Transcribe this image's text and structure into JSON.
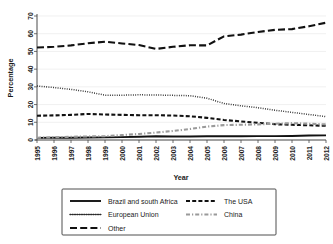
{
  "chart_data": {
    "type": "line",
    "title": "",
    "xlabel": "Year",
    "ylabel": "Percentage",
    "ylim": [
      0,
      70
    ],
    "yticks": [
      0,
      10,
      20,
      30,
      40,
      50,
      60,
      70
    ],
    "grid": true,
    "legend_position": "bottom",
    "x": [
      1995,
      1996,
      1997,
      1998,
      1999,
      2000,
      2001,
      2002,
      2003,
      2004,
      2005,
      2006,
      2007,
      2008,
      2009,
      2010,
      2011,
      2012
    ],
    "categories": [
      "1995",
      "1996",
      "1997",
      "1998",
      "1999",
      "2000",
      "2001",
      "2002",
      "2003",
      "2004",
      "2005",
      "2006",
      "2007",
      "2008",
      "2009",
      "2010",
      "2011",
      "2012"
    ],
    "series": [
      {
        "name": "Brazil and south Africa",
        "style": "solid",
        "color": "#111111",
        "values": [
          1.2,
          1.3,
          1.3,
          1.4,
          1.5,
          1.6,
          1.8,
          2.1,
          2.0,
          2.0,
          2.1,
          2.1,
          2.1,
          2.2,
          2.2,
          2.3,
          2.5,
          2.6
        ]
      },
      {
        "name": "The USA",
        "style": "dashed",
        "color": "#111111",
        "values": [
          13.7,
          13.9,
          14.2,
          14.7,
          14.4,
          14.2,
          14.0,
          14.0,
          13.8,
          13.4,
          12.5,
          11.3,
          10.5,
          9.7,
          8.9,
          8.6,
          8.3,
          8.0
        ]
      },
      {
        "name": "European Union",
        "style": "dotted",
        "color": "#2a2a2a",
        "values": [
          30.5,
          29.6,
          28.6,
          27.2,
          25.3,
          25.3,
          25.5,
          25.4,
          25.2,
          25.0,
          23.6,
          20.6,
          19.3,
          18.2,
          16.8,
          15.6,
          14.4,
          13.2
        ]
      },
      {
        "name": "China",
        "style": "dashdot",
        "color": "#9a9a9a",
        "values": [
          1.3,
          1.5,
          1.8,
          2.0,
          2.2,
          2.8,
          3.4,
          4.2,
          5.1,
          6.2,
          7.6,
          8.4,
          8.6,
          8.8,
          9.2,
          9.5,
          9.2,
          8.8
        ]
      },
      {
        "name": "Other",
        "style": "longdash",
        "color": "#111111",
        "values": [
          52.2,
          52.6,
          53.4,
          54.6,
          55.5,
          54.5,
          53.6,
          51.4,
          52.6,
          53.5,
          53.4,
          58.5,
          59.5,
          61.0,
          62.2,
          62.6,
          64.2,
          66.2
        ]
      }
    ],
    "legend_entries": [
      {
        "label": "Brazil and south Africa",
        "style": "solid",
        "color": "#111111"
      },
      {
        "label": "The USA",
        "style": "dashed",
        "color": "#111111"
      },
      {
        "label": "European Union",
        "style": "dotted",
        "color": "#2a2a2a"
      },
      {
        "label": "China",
        "style": "dashdot",
        "color": "#9a9a9a"
      },
      {
        "label": "Other",
        "style": "longdash",
        "color": "#111111"
      }
    ]
  }
}
